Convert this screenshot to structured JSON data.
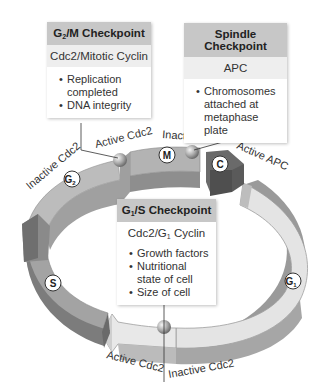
{
  "checkpoints": {
    "g2m": {
      "title_prefix": "G",
      "title_sub": "2",
      "title_suffix": "/M Checkpoint",
      "complex": "Cdc2/Mitotic Cyclin",
      "conditions": [
        "Replication completed",
        "DNA integrity"
      ]
    },
    "spindle": {
      "title": "Spindle Checkpoint",
      "complex": "APC",
      "conditions": [
        "Chromosomes attached at metaphase plate"
      ]
    },
    "g1s": {
      "title_prefix": "G",
      "title_sub": "1",
      "title_suffix": "/S Checkpoint",
      "complex_prefix": "Cdc2/G",
      "complex_sub": "1",
      "complex_suffix": " Cyclin",
      "conditions": [
        "Growth factors",
        "Nutritional state of cell",
        "Size of cell"
      ]
    }
  },
  "ring_labels": {
    "active_cdc2_top": "Active Cdc2",
    "inactive_cdc2_left": "Inactive Cdc2",
    "inactive_apc": "Inactive APC",
    "active_apc": "Active APC",
    "active_cdc2_bottom": "Active Cdc2",
    "inactive_cdc2_bottom": "Inactive Cdc2"
  },
  "phases": {
    "m": "M",
    "c": "C",
    "g2": "G",
    "g2_sub": "2",
    "s": "S",
    "g1": "G",
    "g1_sub": "1"
  },
  "colors": {
    "header_gray": "#c7c7c7",
    "subheader_gray": "#eeeeee",
    "ring_mid": "#a8a8a8",
    "ring_dark": "#7a7a7a",
    "ring_light": "#e2e2e2",
    "cytokinesis_dark": "#5e5e5e"
  }
}
